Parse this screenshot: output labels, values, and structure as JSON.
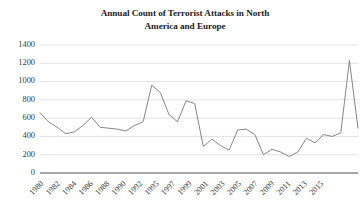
{
  "chart_data": {
    "type": "line",
    "title": "Annual Count of Terrorist Attacks in North America and Europe",
    "title_line1": "Annual Count of Terrorist Attacks in North",
    "title_line2": "America and Europe",
    "xlabel": "",
    "ylabel": "",
    "ylim": [
      0,
      1400
    ],
    "ytick_values": [
      0,
      200,
      400,
      600,
      800,
      1000,
      1200,
      1400
    ],
    "ytick_labels": [
      "0",
      "200",
      "400",
      "600",
      "800",
      "1000",
      "1200",
      "1400"
    ],
    "xtick_labels": [
      "1980",
      "1982",
      "1984",
      "1986",
      "1988",
      "1990",
      "1992",
      "1995",
      "1997",
      "1999",
      "2001",
      "2003",
      "2005",
      "2007",
      "2009",
      "2011",
      "2013",
      "2015"
    ],
    "grid": true,
    "grid_axis": "y",
    "legend": false,
    "legend_position": "none",
    "line_color": "#808080",
    "grid_color": "#d6d6d6",
    "axis_color": "#8a8a8a",
    "x": [
      1980,
      1981,
      1982,
      1983,
      1984,
      1985,
      1986,
      1987,
      1988,
      1989,
      1990,
      1991,
      1992,
      1993,
      1994,
      1995,
      1996,
      1997,
      1998,
      1999,
      2000,
      2001,
      2002,
      2003,
      2004,
      2005,
      2006,
      2007,
      2008,
      2009,
      2010,
      2011,
      2012,
      2013,
      2014,
      2015,
      2016,
      2017
    ],
    "values": [
      660,
      560,
      500,
      430,
      450,
      520,
      610,
      500,
      490,
      480,
      460,
      520,
      560,
      960,
      880,
      640,
      560,
      790,
      760,
      290,
      370,
      300,
      250,
      470,
      480,
      420,
      200,
      260,
      230,
      180,
      230,
      380,
      330,
      420,
      400,
      440,
      1230,
      490
    ],
    "series": [
      {
        "name": "Terrorist attacks",
        "color": "#808080",
        "values": [
          660,
          560,
          500,
          430,
          450,
          520,
          610,
          500,
          490,
          480,
          460,
          520,
          560,
          960,
          880,
          640,
          560,
          790,
          760,
          290,
          370,
          300,
          250,
          470,
          480,
          420,
          200,
          260,
          230,
          180,
          230,
          380,
          330,
          420,
          400,
          440,
          1230,
          490
        ]
      }
    ],
    "annotations": [
      {
        "label": "peak",
        "x": 1993,
        "y": 960
      },
      {
        "label": "spike",
        "x": 2016,
        "y": 1230
      }
    ]
  }
}
